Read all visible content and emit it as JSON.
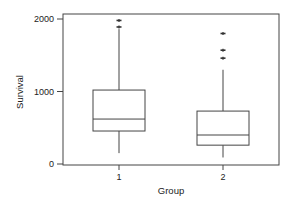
{
  "chart_data": {
    "type": "boxplot",
    "title": "",
    "xlabel": "Group",
    "ylabel": "Survival",
    "categories": [
      "1",
      "2"
    ],
    "yticks": [
      0,
      1000,
      2000
    ],
    "ylim": [
      -20,
      2080
    ],
    "grid": false,
    "legend": null,
    "series": [
      {
        "name": "1",
        "whisker_low": 150,
        "q1": 455,
        "median": 620,
        "q3": 1020,
        "whisker_high": 1860,
        "outliers": [
          1890,
          1980
        ]
      },
      {
        "name": "2",
        "whisker_low": 90,
        "q1": 260,
        "median": 400,
        "q3": 730,
        "whisker_high": 1300,
        "outliers": [
          1460,
          1570,
          1800
        ]
      }
    ]
  }
}
